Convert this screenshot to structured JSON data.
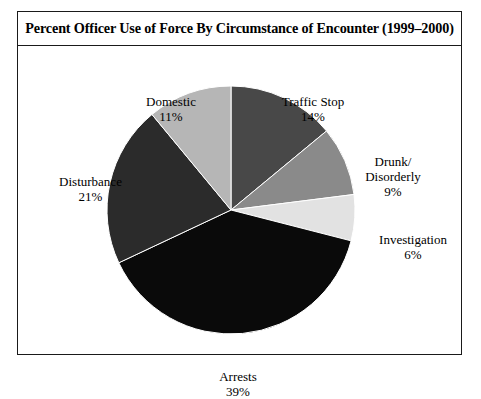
{
  "figure": {
    "title": "Percent Officer Use of Force By Circumstance of Encounter (1999–2000)",
    "border_color": "#1a1a1a",
    "background_color": "#ffffff"
  },
  "labels": {
    "domestic": {
      "name": "Domestic",
      "value": "11%"
    },
    "traffic_stop": {
      "name": "Traffic Stop",
      "value": "14%"
    },
    "drunk_line1": "Drunk/",
    "drunk_line2": "Disorderly",
    "drunk_value": "9%",
    "investigation": {
      "name": "Investigation",
      "value": "6%"
    },
    "disturbance": {
      "name": "Disturbance",
      "value": "21%"
    },
    "arrests": {
      "name": "Arrests",
      "value": "39%"
    }
  },
  "chart_data": {
    "type": "pie",
    "title": "Percent Officer Use of Force By Circumstance of Encounter (1999–2000)",
    "xlabel": "",
    "ylabel": "",
    "units": "percent",
    "start_angle_deg": 0,
    "direction": "clockwise",
    "legend": "none",
    "grid": false,
    "labels_position": "outside",
    "categories": [
      "Traffic Stop",
      "Drunk/Disorderly",
      "Investigation",
      "Arrests",
      "Disturbance",
      "Domestic"
    ],
    "values": [
      14,
      9,
      6,
      39,
      21,
      11
    ],
    "total": 100,
    "slices": [
      {
        "label": "Traffic Stop",
        "value": 14,
        "display": "14%",
        "color": "#484848",
        "start_deg": 0.0,
        "end_deg": 50.4
      },
      {
        "label": "Drunk/Disorderly",
        "value": 9,
        "display": "9%",
        "color": "#8a8a8a",
        "start_deg": 50.4,
        "end_deg": 82.8
      },
      {
        "label": "Investigation",
        "value": 6,
        "display": "6%",
        "color": "#e2e2e2",
        "start_deg": 82.8,
        "end_deg": 104.4
      },
      {
        "label": "Arrests",
        "value": 39,
        "display": "39%",
        "color": "#0a0a0a",
        "start_deg": 104.4,
        "end_deg": 244.8
      },
      {
        "label": "Disturbance",
        "value": 21,
        "display": "21%",
        "color": "#2b2b2b",
        "start_deg": 244.8,
        "end_deg": 320.4
      },
      {
        "label": "Domestic",
        "value": 11,
        "display": "11%",
        "color": "#b6b6b6",
        "start_deg": 320.4,
        "end_deg": 360.0
      }
    ]
  }
}
